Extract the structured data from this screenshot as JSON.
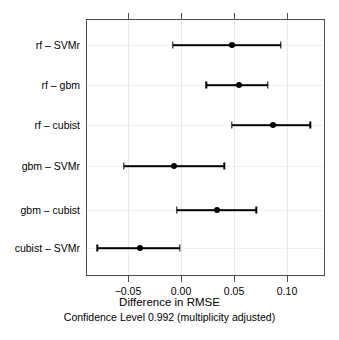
{
  "chart_data": {
    "type": "scatter",
    "title": "",
    "xlabel": "Difference in RMSE",
    "subtitle": "Confidence Level 0.992  (multiplicity adjusted)",
    "ylabel": "",
    "xlim": [
      -0.088,
      0.136
    ],
    "xticks": [
      -0.05,
      0.0,
      0.05,
      0.1
    ],
    "xticklabels": [
      "-0.05",
      "0.00",
      "0.05",
      "0.10"
    ],
    "grid": true,
    "legend": null,
    "reference_line": 0.0,
    "categories": [
      "rf – SVMr",
      "rf – gbm",
      "rf – cubist",
      "gbm – SVMr",
      "gbm – cubist",
      "cubist – SVMr"
    ],
    "points": [
      {
        "label": "rf – SVMr",
        "estimate": 0.048,
        "lower": -0.008,
        "upper": 0.094
      },
      {
        "label": "rf – gbm",
        "estimate": 0.055,
        "lower": 0.024,
        "upper": 0.082
      },
      {
        "label": "rf – cubist",
        "estimate": 0.087,
        "lower": 0.048,
        "upper": 0.122
      },
      {
        "label": "gbm – SVMr",
        "estimate": -0.007,
        "lower": -0.054,
        "upper": 0.041
      },
      {
        "label": "gbm – cubist",
        "estimate": 0.034,
        "lower": -0.004,
        "upper": 0.071
      },
      {
        "label": "cubist – SVMr",
        "estimate": -0.039,
        "lower": -0.079,
        "upper": -0.001
      }
    ]
  },
  "colors": {
    "point": "#000000",
    "line": "#000000",
    "axis": "#4d4d4d",
    "grid": "#ececec",
    "background": "#ffffff"
  }
}
